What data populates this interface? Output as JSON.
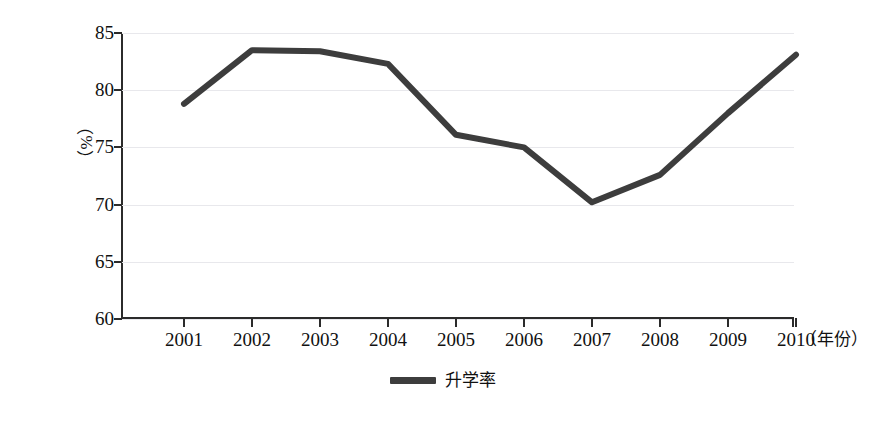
{
  "chart_data": {
    "type": "line",
    "title": "",
    "xlabel": "（年份）",
    "ylabel": "（%）",
    "categories": [
      "2001",
      "2002",
      "2003",
      "2004",
      "2005",
      "2006",
      "2007",
      "2008",
      "2009",
      "2010"
    ],
    "series": [
      {
        "name": "升学率",
        "color": "#3d3d3d",
        "values": [
          78.8,
          83.5,
          83.4,
          82.3,
          76.1,
          75.0,
          70.2,
          72.6,
          78.0,
          83.1
        ]
      }
    ],
    "ylim": [
      60,
      85
    ],
    "y_ticks": [
      85,
      80,
      75,
      70,
      65,
      60
    ],
    "y_tick_labels": [
      "85",
      "80",
      "75",
      "70",
      "65",
      "60"
    ],
    "grid": true,
    "grid_color": "#e8e8ec",
    "legend_position": "bottom-center",
    "axis_color": "#2b2b2b",
    "background": "#ffffff",
    "line_width": 6
  },
  "legend": {
    "entries": [
      {
        "label": "升学率",
        "swatch_color": "#3d3d3d"
      }
    ]
  }
}
